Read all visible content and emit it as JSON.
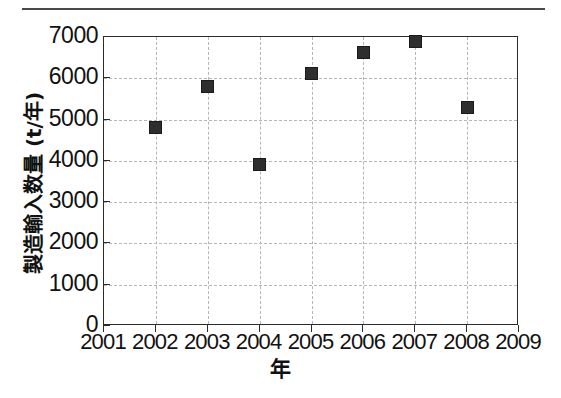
{
  "chart_data": {
    "type": "scatter",
    "title": "",
    "xlabel": "年",
    "ylabel": "製造輸入数量 (t/年)",
    "x": [
      2002,
      2003,
      2004,
      2005,
      2006,
      2007,
      2008
    ],
    "values": [
      4820,
      5790,
      3920,
      6110,
      6620,
      6880,
      5300
    ],
    "points": [
      {
        "x": 2002,
        "y": 4820
      },
      {
        "x": 2003,
        "y": 5790
      },
      {
        "x": 2004,
        "y": 3920
      },
      {
        "x": 2005,
        "y": 6110
      },
      {
        "x": 2006,
        "y": 6620
      },
      {
        "x": 2007,
        "y": 6880
      },
      {
        "x": 2008,
        "y": 5300
      }
    ],
    "xlim": [
      2001,
      2009
    ],
    "ylim": [
      0,
      7000
    ],
    "xticks": [
      2001,
      2002,
      2003,
      2004,
      2005,
      2006,
      2007,
      2008,
      2009
    ],
    "yticks": [
      0,
      1000,
      2000,
      3000,
      4000,
      5000,
      6000,
      7000
    ],
    "xtick_labels": [
      "2001",
      "2002",
      "2003",
      "2004",
      "2005",
      "2006",
      "2007",
      "2008",
      "2009"
    ],
    "ytick_labels": [
      "0",
      "1000",
      "2000",
      "3000",
      "4000",
      "5000",
      "6000",
      "7000"
    ],
    "grid": true,
    "grid_style": "dashed",
    "legend": null,
    "marker": "square",
    "marker_color": "#2e2e2e",
    "grid_color": "#b6b6b6",
    "axis_color": "#2b2b2b"
  }
}
